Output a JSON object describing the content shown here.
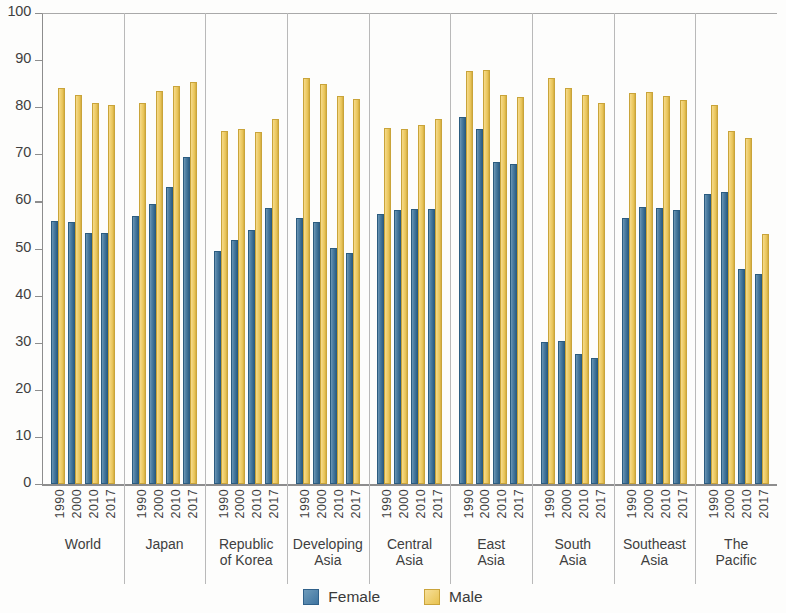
{
  "chart_data": {
    "type": "bar",
    "title": "",
    "subtitle": "",
    "xlabel": "",
    "ylabel": "",
    "ylim": [
      0,
      100
    ],
    "yticks": [
      0,
      10,
      20,
      30,
      40,
      50,
      60,
      70,
      80,
      90,
      100
    ],
    "grid": false,
    "legend_position": "bottom",
    "categories": [
      "World",
      "Japan",
      "Republic\nof Korea",
      "Developing\nAsia",
      "Central\nAsia",
      "East\nAsia",
      "South\nAsia",
      "Southeast\nAsia",
      "The\nPacific"
    ],
    "subcategories": [
      "1990",
      "2000",
      "2010",
      "2017"
    ],
    "series": [
      {
        "name": "Female",
        "color": "#3f74a0",
        "values": [
          [
            55.8,
            55.6,
            53.3,
            53.2
          ],
          [
            57.0,
            59.4,
            63.0,
            69.4
          ],
          [
            49.5,
            51.9,
            54.0,
            58.6
          ],
          [
            56.5,
            55.6,
            50.1,
            49.0
          ],
          [
            57.4,
            58.2,
            58.4,
            58.3
          ],
          [
            78.0,
            75.4,
            68.3,
            68.0
          ],
          [
            30.1,
            30.4,
            27.5,
            26.7
          ],
          [
            56.5,
            58.9,
            58.7,
            58.2
          ],
          [
            61.5,
            62.0,
            45.6,
            44.6
          ]
        ]
      },
      {
        "name": "Male",
        "color": "#e8c24f",
        "values": [
          [
            84.1,
            82.6,
            80.8,
            80.5
          ],
          [
            81.0,
            83.4,
            84.4,
            85.4
          ],
          [
            75.0,
            75.3,
            74.7,
            77.6
          ],
          [
            86.2,
            85.0,
            82.4,
            81.7
          ],
          [
            75.5,
            75.3,
            76.2,
            77.4
          ],
          [
            87.7,
            88.0,
            82.6,
            82.1
          ],
          [
            86.1,
            84.0,
            82.6,
            81.0
          ],
          [
            83.0,
            83.2,
            82.3,
            81.5
          ],
          [
            80.4,
            75.0,
            73.4,
            53.1
          ]
        ]
      }
    ],
    "legend": [
      {
        "label": "Female",
        "color": "#3f74a0"
      },
      {
        "label": "Male",
        "color": "#e8c24f"
      }
    ]
  }
}
